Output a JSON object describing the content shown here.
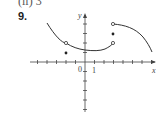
{
  "header": {
    "top_text": "(ii) 3",
    "problem_number": "9."
  },
  "chart_data": {
    "type": "line",
    "title": "",
    "xlabel": "x",
    "ylabel": "y",
    "tick_labels": {
      "origin": "0",
      "x_one": "1"
    },
    "xlim": [
      -5,
      7.5
    ],
    "ylim": [
      -5,
      5
    ],
    "grid": false,
    "pieces": [
      {
        "name": "left-curve",
        "x": [
          -4,
          -3,
          -2,
          -1,
          0,
          1,
          2,
          3
        ],
        "y": [
          4,
          2.9,
          2,
          1.5,
          1.3,
          1.2,
          1.4,
          2
        ],
        "endpoints": {
          "left": "none",
          "right": "open"
        },
        "interior_open_points": [
          [
            -2,
            2
          ]
        ]
      },
      {
        "name": "right-curve",
        "x": [
          3,
          4,
          5,
          6,
          7
        ],
        "y": [
          4,
          3.8,
          3.3,
          2.4,
          1
        ],
        "endpoints": {
          "left": "open",
          "right": "none"
        }
      }
    ],
    "isolated_points": [
      {
        "x": -2,
        "y": 1,
        "filled": true
      },
      {
        "x": 3,
        "y": 3,
        "filled": true
      }
    ],
    "colors": {
      "curve": "#333333",
      "axis": "#444444"
    }
  }
}
